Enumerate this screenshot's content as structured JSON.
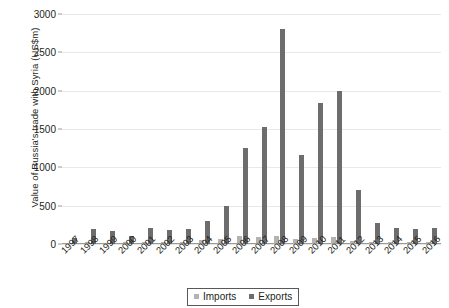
{
  "chart_data": {
    "type": "bar",
    "title": "",
    "xlabel": "",
    "ylabel": "Value of Russia's trade with Syria (US$m)",
    "ylim": [
      0,
      3000
    ],
    "yticks": [
      0,
      500,
      1000,
      1500,
      2000,
      2500,
      3000
    ],
    "ytick_labels": [
      "0",
      "500",
      "1000",
      "1500",
      "2000",
      "2500",
      "3000"
    ],
    "grid": true,
    "legend_position": "bottom-center",
    "categories": [
      "1997",
      "1998",
      "1999",
      "2000",
      "2001",
      "2002",
      "2003",
      "2004",
      "2005",
      "2006",
      "2007",
      "2008",
      "2009",
      "2010",
      "2011",
      "2012",
      "2013",
      "2014",
      "2015",
      "2016"
    ],
    "series": [
      {
        "name": "Imports",
        "color": "#b3b3b3",
        "values": [
          10,
          20,
          15,
          20,
          25,
          30,
          30,
          50,
          70,
          110,
          90,
          100,
          60,
          80,
          90,
          40,
          30,
          25,
          20,
          20
        ]
      },
      {
        "name": "Exports",
        "color": "#6d6d6d",
        "values": [
          80,
          190,
          170,
          110,
          210,
          180,
          200,
          300,
          500,
          1250,
          1520,
          2800,
          1160,
          1840,
          1990,
          700,
          280,
          210,
          200,
          210
        ]
      }
    ]
  },
  "legend": {
    "items": [
      {
        "label": "Imports",
        "color": "#b3b3b3"
      },
      {
        "label": "Exports",
        "color": "#6d6d6d"
      }
    ]
  }
}
